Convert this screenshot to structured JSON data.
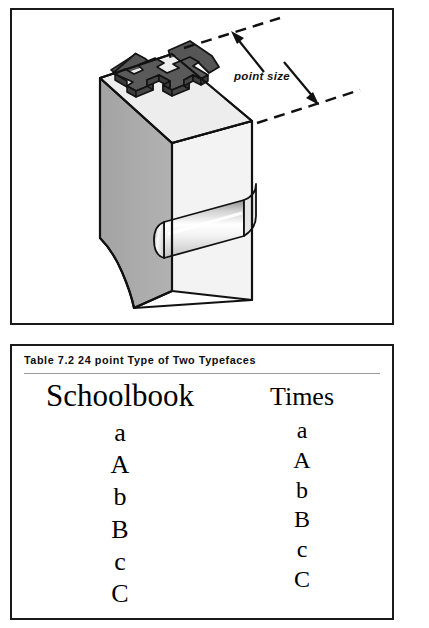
{
  "figure": {
    "name": "type-block-diagram",
    "annotation_label": "point size",
    "letter_on_block": "H",
    "colors": {
      "block_top_face": "#ededed",
      "block_front_face": "#f2f2f2",
      "block_left_face": "#a9a9a9",
      "letter_face": "#565656",
      "letter_side": "#3f3f3f",
      "outline": "#111111",
      "nick_highlight": "#ffffff",
      "nick_shadow": "#9b9b9b"
    }
  },
  "table": {
    "caption": "Table 7.2 24 point Type of Two Typefaces",
    "columns": [
      {
        "name": "schoolbook",
        "heading": "Schoolbook",
        "glyphs": [
          "a",
          "A",
          "b",
          "B",
          "c",
          "C"
        ]
      },
      {
        "name": "times",
        "heading": "Times",
        "glyphs": [
          "a",
          "A",
          "b",
          "B",
          "c",
          "C"
        ]
      }
    ]
  }
}
